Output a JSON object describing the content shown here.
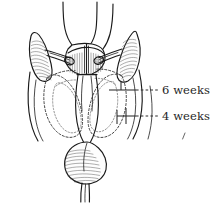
{
  "figure": {
    "background_color": "#ffffff",
    "ink_color": "#1a1a1a",
    "label_color": "#262626"
  },
  "callouts": [
    {
      "id": "six-weeks",
      "label": "6 weeks",
      "leader_style": "solid-then-dashed",
      "leader_y": 90,
      "tick": true
    },
    {
      "id": "four-weeks",
      "label": "4 weeks",
      "leader_style": "solid-then-dashed",
      "leader_y": 116,
      "tick": true
    }
  ],
  "anatomy_parts": [
    {
      "id": "uterine-horn-left",
      "name": "uterine horn left"
    },
    {
      "id": "uterine-horn-right",
      "name": "uterine horn right"
    },
    {
      "id": "broad-ligament-left",
      "name": "broad ligament left"
    },
    {
      "id": "broad-ligament-right",
      "name": "broad ligament right"
    },
    {
      "id": "uterine-body",
      "name": "uterine body"
    },
    {
      "id": "cervix",
      "name": "cervix"
    },
    {
      "id": "vaginal-stump",
      "name": "vaginal stump"
    },
    {
      "id": "involution-outline-6-weeks",
      "name": "involution outline at 6 weeks"
    },
    {
      "id": "involution-outline-4-weeks",
      "name": "involution outline at 4 weeks"
    }
  ]
}
